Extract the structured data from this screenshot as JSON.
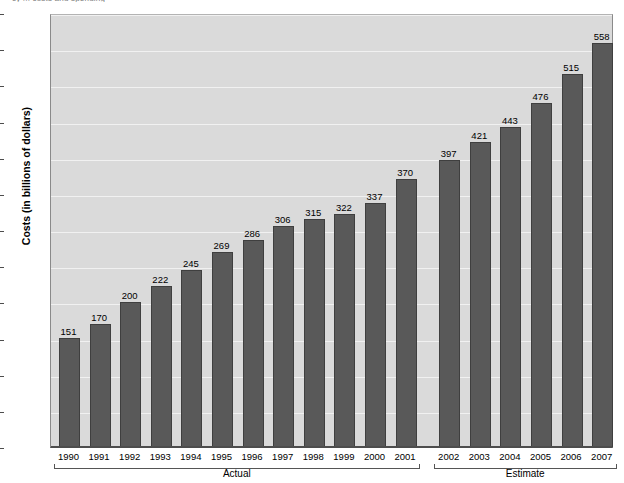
{
  "top_caption": "cy ... costs and spending",
  "chart_data": {
    "type": "bar",
    "title": "",
    "xlabel": "",
    "ylabel": "Costs (in billions of dollars)",
    "ylim": [
      0,
      600
    ],
    "ytick_step": 50,
    "yticks": [
      "0",
      "50",
      "100",
      "150",
      "200",
      "250",
      "300",
      "350",
      "400",
      "450",
      "500",
      "550",
      "600"
    ],
    "grid": true,
    "legend": "none",
    "categories": [
      "1990",
      "1991",
      "1992",
      "1993",
      "1994",
      "1995",
      "1996",
      "1997",
      "1998",
      "1999",
      "2000",
      "2001",
      "2002",
      "2003",
      "2004",
      "2005",
      "2006",
      "2007"
    ],
    "values": [
      151,
      170,
      200,
      222,
      245,
      269,
      286,
      306,
      315,
      322,
      337,
      370,
      397,
      421,
      443,
      476,
      515,
      558
    ],
    "value_labels": [
      "151",
      "170",
      "200",
      "222",
      "245",
      "269",
      "286",
      "306",
      "315",
      "322",
      "337",
      "370",
      "397",
      "421",
      "443",
      "476",
      "515",
      "558"
    ],
    "groups": [
      {
        "label": "Actual",
        "start_index": 0,
        "end_index": 11
      },
      {
        "label": "Estimate",
        "start_index": 12,
        "end_index": 17
      }
    ],
    "colors": {
      "bar": "#595959",
      "bar_border": "#3f3f3f",
      "plot_background": "#dadada",
      "gridline": "#f1f1f1",
      "axis": "#4d4d4d",
      "text": "#000000"
    }
  }
}
